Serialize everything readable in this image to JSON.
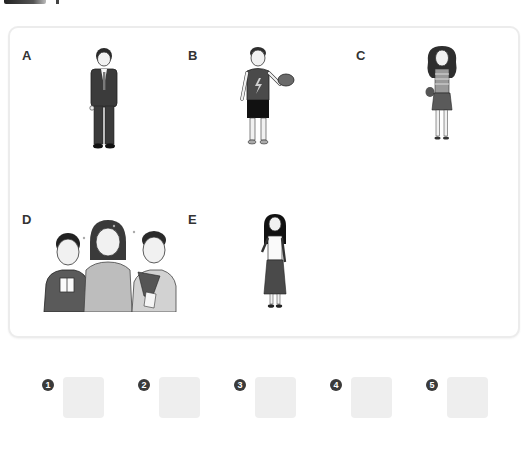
{
  "header": {
    "decor": "dark-gradient-bar"
  },
  "panel": {
    "options": [
      {
        "label": "A",
        "description": "man in dark suit and tie, hand on hip"
      },
      {
        "label": "B",
        "description": "boy in sleeveless lightning-bolt top and shorts holding a cap"
      },
      {
        "label": "C",
        "description": "girl with long curly hair, glasses, striped top, skirt and bag"
      },
      {
        "label": "D",
        "description": "mother with two sons holding a gift and flowers"
      },
      {
        "label": "E",
        "description": "girl with long straight hair, white blouse and long skirt"
      }
    ]
  },
  "answers": [
    {
      "number": "1",
      "value": ""
    },
    {
      "number": "2",
      "value": ""
    },
    {
      "number": "3",
      "value": ""
    },
    {
      "number": "4",
      "value": ""
    },
    {
      "number": "5",
      "value": ""
    }
  ],
  "colors": {
    "panel_border": "#ececec",
    "answer_box": "#eeeeee",
    "number_badge": "#3a3a3a"
  }
}
